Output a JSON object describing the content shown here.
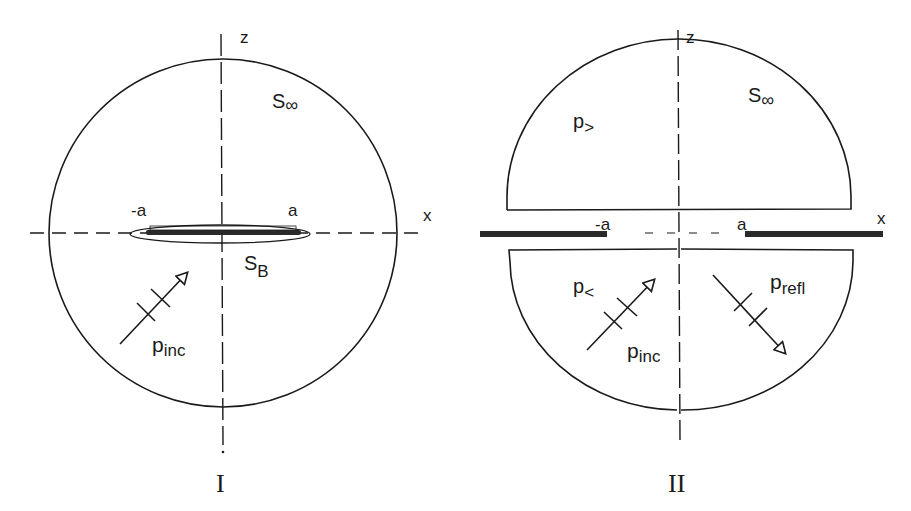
{
  "figure": {
    "panels": [
      {
        "id": "I",
        "caption": "I",
        "axes": {
          "horizontal": "x",
          "vertical": "z"
        },
        "labels": {
          "surface_infinity": "S",
          "surface_infinity_sub": "∞",
          "surface_body": "S",
          "surface_body_sub": "B",
          "minus_a": "-a",
          "plus_a": "a",
          "incident": "p",
          "incident_sub": "inc"
        }
      },
      {
        "id": "II",
        "caption": "II",
        "axes": {
          "horizontal": "x",
          "vertical": "z"
        },
        "labels": {
          "surface_infinity": "S",
          "surface_infinity_sub": "∞",
          "upper_field": "p",
          "upper_field_sub": ">",
          "lower_field": "p",
          "lower_field_sub": "<",
          "minus_a": "-a",
          "plus_a": "a",
          "incident": "p",
          "incident_sub": "inc",
          "reflected": "p",
          "reflected_sub": "refl"
        }
      }
    ],
    "colors": {
      "ink": "#1a1a1a",
      "background": "#ffffff"
    }
  }
}
